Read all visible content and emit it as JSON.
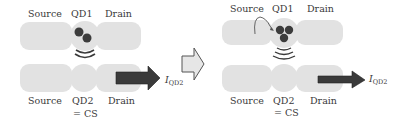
{
  "colors": {
    "block": "#e2e2e2",
    "dot": "#3c3c3c",
    "arrow": "#3a3a3a",
    "hollow_arrow_fill": "#e6e6e6",
    "text": "#3a3a3a"
  },
  "left_panel": {
    "top_labels": {
      "source": "Source",
      "qd1": "QD1",
      "drain": "Drain"
    },
    "bottom_labels": {
      "source": "Source",
      "qd2": "QD2",
      "cs": "= CS",
      "drain": "Drain"
    },
    "current_label": {
      "main": "I",
      "sub": "QD2"
    },
    "electron_count": 2
  },
  "transition_arrow": "hollow-right-arrow",
  "right_panel": {
    "top_labels": {
      "source": "Source",
      "qd1": "QD1",
      "drain": "Drain"
    },
    "bottom_labels": {
      "source": "Source",
      "qd2": "QD2",
      "cs": "= CS",
      "drain": "Drain"
    },
    "current_label": {
      "main": "I",
      "sub": "QD2"
    },
    "electron_count": 3
  }
}
